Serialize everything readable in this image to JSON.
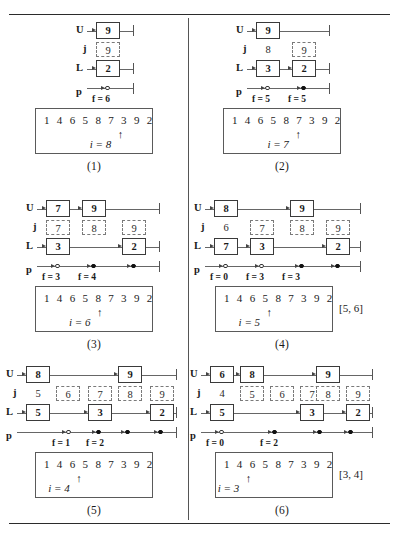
{
  "figure": {
    "title": "",
    "array_base": "1 4 6 5 8 7 3 9 2",
    "row_labels": {
      "u": "U",
      "j": "j",
      "l": "L",
      "p": "p"
    }
  },
  "panels": [
    {
      "caption": "(1)",
      "u_cells": [
        {
          "value": "9",
          "left": 96,
          "width": 24
        }
      ],
      "j_cells": [
        {
          "value": "9",
          "left": 96,
          "width": 24,
          "style": "dash"
        }
      ],
      "l_cells": [
        {
          "value": "2",
          "left": 96,
          "width": 24
        }
      ],
      "p_markers": [
        {
          "left": 105,
          "type": "open"
        }
      ],
      "f_labels": [
        {
          "text": "f = 6",
          "left": 92
        }
      ],
      "line_end": 133,
      "array": {
        "values": "1 4 6 5 8 7 3 9 2",
        "arrow_index": 7,
        "i_label": "i = 8"
      },
      "range": ""
    },
    {
      "caption": "(2)",
      "u_cells": [
        {
          "value": "9",
          "left": 68,
          "width": 24
        }
      ],
      "j_cells": [
        {
          "value": "8",
          "left": 68,
          "width": 24,
          "style": "plain"
        },
        {
          "value": "9",
          "left": 104,
          "width": 24,
          "style": "dash"
        }
      ],
      "l_cells": [
        {
          "value": "3",
          "left": 68,
          "width": 24
        },
        {
          "value": "2",
          "left": 104,
          "width": 24
        }
      ],
      "p_markers": [
        {
          "left": 77,
          "type": "open"
        },
        {
          "left": 113,
          "type": "filled"
        }
      ],
      "f_labels": [
        {
          "text": "f = 5",
          "left": 64
        },
        {
          "text": "f = 5",
          "left": 100
        }
      ],
      "line_end": 141,
      "array": {
        "values": "1 4 6 5 8 7 3 9 2",
        "arrow_index": 6,
        "i_label": "i = 7"
      },
      "range": ""
    },
    {
      "caption": "(3)",
      "u_cells": [
        {
          "value": "7",
          "left": 46,
          "width": 24
        },
        {
          "value": "9",
          "left": 82,
          "width": 24
        }
      ],
      "j_cells": [
        {
          "value": "7",
          "left": 46,
          "width": 24,
          "style": "dash"
        },
        {
          "value": "8",
          "left": 82,
          "width": 24,
          "style": "dash"
        },
        {
          "value": "9",
          "left": 122,
          "width": 24,
          "style": "dash"
        }
      ],
      "l_cells": [
        {
          "value": "3",
          "left": 46,
          "width": 24
        },
        {
          "value": "2",
          "left": 122,
          "width": 24
        }
      ],
      "p_markers": [
        {
          "left": 55,
          "type": "open"
        },
        {
          "left": 91,
          "type": "filled"
        },
        {
          "left": 131,
          "type": "filled"
        }
      ],
      "f_labels": [
        {
          "text": "f = 3",
          "left": 42
        },
        {
          "text": "f = 4",
          "left": 78
        }
      ],
      "line_end": 159,
      "array": {
        "values": "1 4 6 5 8 7 3 9 2",
        "arrow_index": 5,
        "i_label": "i = 6"
      },
      "range": ""
    },
    {
      "caption": "(4)",
      "u_cells": [
        {
          "value": "8",
          "left": 26,
          "width": 24
        },
        {
          "value": "9",
          "left": 102,
          "width": 24
        }
      ],
      "j_cells": [
        {
          "value": "6",
          "left": 26,
          "width": 24,
          "style": "plain"
        },
        {
          "value": "7",
          "left": 62,
          "width": 24,
          "style": "dash"
        },
        {
          "value": "8",
          "left": 102,
          "width": 24,
          "style": "dash"
        },
        {
          "value": "9",
          "left": 138,
          "width": 24,
          "style": "dash"
        }
      ],
      "l_cells": [
        {
          "value": "7",
          "left": 26,
          "width": 24
        },
        {
          "value": "3",
          "left": 62,
          "width": 24
        },
        {
          "value": "2",
          "left": 138,
          "width": 24
        }
      ],
      "p_markers": [
        {
          "left": 35,
          "type": "open"
        },
        {
          "left": 71,
          "type": "open"
        },
        {
          "left": 111,
          "type": "filled"
        },
        {
          "left": 147,
          "type": "filled"
        }
      ],
      "f_labels": [
        {
          "text": "f = 0",
          "left": 22
        },
        {
          "text": "f = 3",
          "left": 58
        },
        {
          "text": "f = 3",
          "left": 94
        }
      ],
      "line_end": 172,
      "array": {
        "values": "1 4 6 5 8 7 3 9 2",
        "arrow_index": 4,
        "i_label": "i = 5"
      },
      "range": "[5, 6]"
    },
    {
      "caption": "(5)",
      "u_cells": [
        {
          "value": "8",
          "left": 26,
          "width": 24
        },
        {
          "value": "9",
          "left": 118,
          "width": 24
        }
      ],
      "j_cells": [
        {
          "value": "5",
          "left": 26,
          "width": 24,
          "style": "plain"
        },
        {
          "value": "6",
          "left": 56,
          "width": 24,
          "style": "dash"
        },
        {
          "value": "7",
          "left": 88,
          "width": 24,
          "style": "dash"
        },
        {
          "value": "8",
          "left": 118,
          "width": 24,
          "style": "dash"
        },
        {
          "value": "9",
          "left": 150,
          "width": 24,
          "style": "dash"
        }
      ],
      "l_cells": [
        {
          "value": "5",
          "left": 26,
          "width": 24
        },
        {
          "value": "3",
          "left": 88,
          "width": 24
        },
        {
          "value": "2",
          "left": 150,
          "width": 24
        }
      ],
      "p_markers": [
        {
          "left": 66,
          "type": "open"
        },
        {
          "left": 96,
          "type": "filled"
        },
        {
          "left": 125,
          "type": "filled"
        },
        {
          "left": 158,
          "type": "filled"
        }
      ],
      "f_labels": [
        {
          "text": "f = 1",
          "left": 52
        },
        {
          "text": "f = 2",
          "left": 86
        }
      ],
      "line_end": 176,
      "array": {
        "values": "1 4 6 5 8 7 3 9 2",
        "arrow_index": 3,
        "i_label": "i = 4"
      },
      "range": ""
    },
    {
      "caption": "(6)",
      "u_cells": [
        {
          "value": "6",
          "left": 22,
          "width": 24
        },
        {
          "value": "8",
          "left": 52,
          "width": 24
        },
        {
          "value": "9",
          "left": 128,
          "width": 24
        }
      ],
      "j_cells": [
        {
          "value": "4",
          "left": 22,
          "width": 24,
          "style": "plain"
        },
        {
          "value": "5",
          "left": 52,
          "width": 24,
          "style": "dash"
        },
        {
          "value": "6",
          "left": 82,
          "width": 24,
          "style": "dash"
        },
        {
          "value": "7",
          "left": 112,
          "width": 24,
          "style": "dash"
        },
        {
          "value": "8",
          "left": 128,
          "width": 24,
          "style": "dash"
        },
        {
          "value": "9",
          "left": 158,
          "width": 24,
          "style": "dash"
        }
      ],
      "l_cells": [
        {
          "value": "5",
          "left": 22,
          "width": 24
        },
        {
          "value": "3",
          "left": 112,
          "width": 24
        },
        {
          "value": "2",
          "left": 158,
          "width": 24
        }
      ],
      "p_markers": [
        {
          "left": 31,
          "type": "open"
        },
        {
          "left": 84,
          "type": "filled"
        },
        {
          "left": 129,
          "type": "filled"
        },
        {
          "left": 160,
          "type": "filled"
        }
      ],
      "f_labels": [
        {
          "text": "f = 0",
          "left": 18
        },
        {
          "text": "f = 2",
          "left": 72
        }
      ],
      "line_end": 184,
      "array": {
        "values": "1 4 6 5 8 7 3 9 2",
        "arrow_index": 2,
        "i_label": "i = 3"
      },
      "range": "[3, 4]"
    }
  ]
}
